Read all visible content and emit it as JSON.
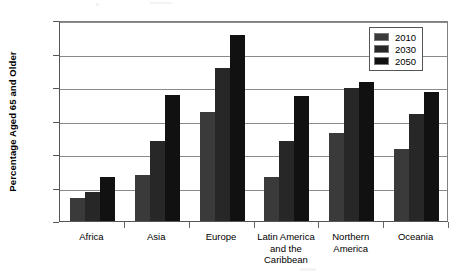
{
  "chart_data": {
    "type": "bar",
    "title": "",
    "subtitle": "",
    "xlabel": "",
    "ylabel": "Percentage Aged 65 and Older",
    "ylim": [
      0,
      30
    ],
    "yticks": [
      0,
      5,
      10,
      15,
      20,
      25,
      30
    ],
    "grid": true,
    "legend_position": "top-right",
    "categories": [
      "Africa",
      "Asia",
      "Europe",
      "Latin America and the Caribbean",
      "Northern America",
      "Oceania"
    ],
    "category_lines": [
      [
        "Africa"
      ],
      [
        "Asia"
      ],
      [
        "Europe"
      ],
      [
        "Latin America",
        "and the",
        "Caribbean"
      ],
      [
        "Northern",
        "America"
      ],
      [
        "Oceania"
      ]
    ],
    "series": [
      {
        "name": "2010",
        "color": "#3a3a3a",
        "values": [
          3.5,
          6.9,
          16.2,
          6.6,
          13.1,
          10.8
        ]
      },
      {
        "name": "2030",
        "color": "#272727",
        "values": [
          4.4,
          12.0,
          22.8,
          11.9,
          19.9,
          15.9
        ]
      },
      {
        "name": "2050",
        "color": "#111111",
        "values": [
          6.6,
          18.8,
          27.8,
          18.7,
          20.8,
          19.2
        ]
      }
    ]
  }
}
